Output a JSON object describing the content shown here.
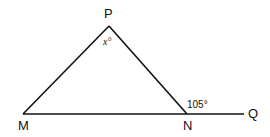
{
  "diagram": {
    "type": "geometry-triangle",
    "points": {
      "P": {
        "label": "P",
        "x": 109,
        "y": 26
      },
      "M": {
        "label": "M",
        "x": 23,
        "y": 114
      },
      "N": {
        "label": "N",
        "x": 187,
        "y": 114
      },
      "Q": {
        "label": "Q",
        "x": 244,
        "y": 114
      }
    },
    "angles": {
      "apex": {
        "vertex": "P",
        "label": "x°"
      },
      "exterior": {
        "vertex": "N",
        "between": [
          "P",
          "Q"
        ],
        "label": "105°"
      }
    },
    "segments": [
      [
        "M",
        "P"
      ],
      [
        "P",
        "N"
      ],
      [
        "M",
        "Q"
      ]
    ],
    "stroke_color": "#111111"
  }
}
